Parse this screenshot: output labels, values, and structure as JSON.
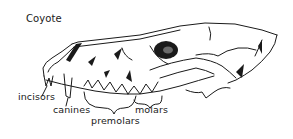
{
  "diagram": {
    "title": "Coyote",
    "labels": [
      {
        "id": "incisors",
        "text": "incisors"
      },
      {
        "id": "canines",
        "text": "canines"
      },
      {
        "id": "premolars",
        "text": "premolars"
      },
      {
        "id": "molars",
        "text": "molars"
      }
    ],
    "colors": {
      "ink": "#1a1a1a",
      "background": "#ffffff"
    }
  }
}
